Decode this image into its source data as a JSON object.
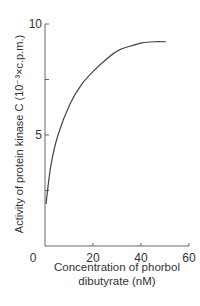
{
  "chart_data": {
    "type": "line",
    "title": "",
    "xlabel": "Concentration of phorbol dibutyrate (nM)",
    "xlabel_lines": [
      "Concentration of phorbol",
      "dibutyrate (nM)"
    ],
    "ylabel": "Activity of protein kinase C (10⁻³×c.p.m.)",
    "xlim": [
      0,
      60
    ],
    "ylim": [
      0,
      10
    ],
    "xticks": [
      0,
      20,
      40,
      60
    ],
    "yticks": [
      5,
      10
    ],
    "grid": false,
    "legend": null,
    "series": [
      {
        "name": "Protein kinase C activity",
        "x": [
          0,
          2,
          5,
          10,
          15,
          20,
          25,
          30,
          35,
          40,
          45,
          50
        ],
        "y": [
          1.9,
          3.6,
          5.0,
          6.4,
          7.3,
          7.9,
          8.4,
          8.8,
          9.0,
          9.15,
          9.2,
          9.2
        ]
      }
    ]
  },
  "axis_labels": {
    "x_line1": "Concentration of phorbol",
    "x_line2": "dibutyrate (nM)",
    "y": "Activity of protein kinase C (10⁻³×c.p.m.)"
  },
  "tick_labels": {
    "x": [
      "0",
      "20",
      "40",
      "60"
    ],
    "y": [
      "5",
      "10"
    ]
  },
  "colors": {
    "line": "#444444",
    "axis": "#666666"
  }
}
